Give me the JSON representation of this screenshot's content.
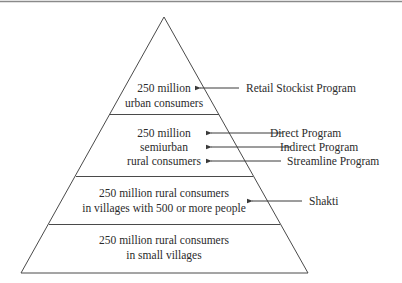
{
  "diagram": {
    "type": "pyramid",
    "colors": {
      "line": "#4a4a4a",
      "text": "#2b2b2b",
      "top_border": "#8a8a8a",
      "background": "#ffffff"
    },
    "tiers": [
      {
        "lines": [
          "250 million",
          "urban consumers"
        ]
      },
      {
        "lines": [
          "250 million",
          "semiurban",
          "rural consumers"
        ]
      },
      {
        "lines": [
          "250 million rural consumers",
          "in villages with 500 or more people"
        ]
      },
      {
        "lines": [
          "250 million rural consumers",
          "in small villages"
        ]
      }
    ],
    "programs": [
      {
        "label": "Retail Stockist Program",
        "points_to": "tier 1"
      },
      {
        "label": "Direct Program",
        "points_to": "tier 2"
      },
      {
        "label": "Indirect Program",
        "points_to": "tier 2"
      },
      {
        "label": "Streamline Program",
        "points_to": "tier 2"
      },
      {
        "label": "Shakti",
        "points_to": "tier 3"
      }
    ]
  }
}
